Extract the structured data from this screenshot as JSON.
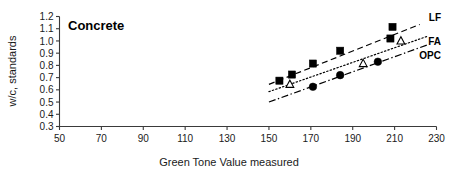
{
  "chart_data": {
    "type": "scatter",
    "title": "Concrete",
    "xlabel": "Green Tone Value measured",
    "ylabel": "w/c, standards",
    "xlim": [
      50,
      230
    ],
    "ylim": [
      0.3,
      1.2
    ],
    "xticks": [
      "50",
      "70",
      "90",
      "110",
      "130",
      "150",
      "170",
      "190",
      "210",
      "230"
    ],
    "yticks": [
      "0.3",
      "0.4",
      "0.5",
      "0.6",
      "0.7",
      "0.8",
      "0.9",
      "1.0",
      "1.1",
      "1.2"
    ],
    "grid": false,
    "legend_position": "right-inline",
    "series": [
      {
        "name": "LF",
        "marker": "filled-square",
        "line_style": "dashed",
        "points": [
          {
            "x": 155,
            "y": 0.675
          },
          {
            "x": 161,
            "y": 0.725
          },
          {
            "x": 171,
            "y": 0.815
          },
          {
            "x": 184,
            "y": 0.92
          },
          {
            "x": 208,
            "y": 1.02
          },
          {
            "x": 209,
            "y": 1.115
          }
        ],
        "fit_line": {
          "x0": 150,
          "y0": 0.645,
          "x1": 222,
          "y1": 1.135
        }
      },
      {
        "name": "FA",
        "marker": "open-triangle",
        "line_style": "dotted",
        "points": [
          {
            "x": 160,
            "y": 0.645
          },
          {
            "x": 195,
            "y": 0.815
          },
          {
            "x": 213,
            "y": 1.0
          }
        ],
        "fit_line": {
          "x0": 150,
          "y0": 0.585,
          "x1": 226,
          "y1": 1.04
        }
      },
      {
        "name": "OPC",
        "marker": "filled-circle",
        "line_style": "dash-dot",
        "points": [
          {
            "x": 171,
            "y": 0.625
          },
          {
            "x": 184,
            "y": 0.72
          },
          {
            "x": 202,
            "y": 0.83
          }
        ],
        "fit_line": {
          "x0": 150,
          "y0": 0.5,
          "x1": 226,
          "y1": 0.97
        }
      }
    ]
  }
}
